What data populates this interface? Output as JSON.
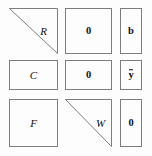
{
  "figure": {
    "background_color": "#fdfdfd",
    "border_color": "#7d7d7d",
    "text_color": "#111111",
    "grid": {
      "rows": 3,
      "cols": 3
    }
  },
  "blocks": [
    {
      "id": "r1c1",
      "label": "R",
      "shape": "upper-triangle",
      "style": "italic",
      "name": "block-r"
    },
    {
      "id": "r1c2",
      "label": "0",
      "shape": "rectangle",
      "style": "bold",
      "name": "block-zero-top"
    },
    {
      "id": "r1c3",
      "label": "b",
      "shape": "rectangle",
      "style": "bold",
      "name": "block-b"
    },
    {
      "id": "r2c1",
      "label": "C",
      "shape": "rectangle",
      "style": "italic",
      "name": "block-c"
    },
    {
      "id": "r2c2",
      "label": "0",
      "shape": "rectangle",
      "style": "bold",
      "name": "block-zero-middle"
    },
    {
      "id": "r2c3",
      "label": "y",
      "label_accent": "overbar",
      "shape": "rectangle",
      "style": "bold",
      "name": "block-y-bar"
    },
    {
      "id": "r3c1",
      "label": "F",
      "shape": "rectangle",
      "style": "italic",
      "name": "block-f"
    },
    {
      "id": "r3c2",
      "label": "W",
      "shape": "upper-triangle",
      "style": "italic",
      "name": "block-w"
    },
    {
      "id": "r3c3",
      "label": "0",
      "shape": "rectangle",
      "style": "bold",
      "name": "block-zero-bottom"
    }
  ]
}
